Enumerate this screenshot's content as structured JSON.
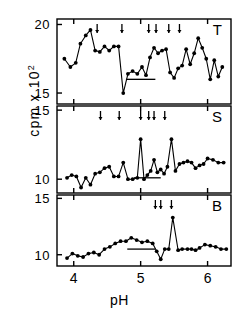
{
  "figure": {
    "ylabel_main": "cpm x 10",
    "ylabel_exp": "2",
    "xlabel": "pH",
    "background": "#ffffff",
    "ink": "#000000"
  },
  "chart_data": {
    "type": "line",
    "title": "",
    "xlabel": "pH",
    "ylabel": "cpm x 10^2",
    "grid": false,
    "legend": "none",
    "xlim": [
      3.75,
      6.35
    ],
    "xticks": [
      4,
      5,
      6
    ],
    "xticklabels": [
      "4",
      "5",
      "6"
    ],
    "panels": [
      {
        "label": "T",
        "label_position": "top-right",
        "ylim": [
          14.2,
          20.4
        ],
        "yticks": [
          15,
          20
        ],
        "yticklabels": [
          "15",
          "20"
        ],
        "marker": "filled-circle",
        "reference_bar": {
          "x_start": 4.78,
          "x_end": 5.22,
          "y": 16.0
        },
        "arrows": [
          4.35,
          4.72,
          5.12,
          5.23,
          5.42,
          5.58
        ],
        "x": [
          3.86,
          3.95,
          4.03,
          4.1,
          4.18,
          4.25,
          4.32,
          4.39,
          4.46,
          4.53,
          4.6,
          4.67,
          4.74,
          4.81,
          4.88,
          4.95,
          5.02,
          5.08,
          5.14,
          5.2,
          5.26,
          5.32,
          5.38,
          5.44,
          5.5,
          5.56,
          5.62,
          5.68,
          5.74,
          5.8,
          5.86,
          5.92,
          5.98,
          6.04,
          6.1,
          6.16,
          6.22
        ],
        "y": [
          17.5,
          16.9,
          17.2,
          18.6,
          19.2,
          19.6,
          18.1,
          18.0,
          18.4,
          18.1,
          18.4,
          18.4,
          15.0,
          16.4,
          16.6,
          16.4,
          16.9,
          16.3,
          17.6,
          18.3,
          17.9,
          18.1,
          18.2,
          16.5,
          16.1,
          16.8,
          17.0,
          18.2,
          17.1,
          17.9,
          19.0,
          18.3,
          17.5,
          16.0,
          17.4,
          16.2,
          16.9
        ]
      },
      {
        "label": "S",
        "label_position": "top-right",
        "ylim": [
          9.0,
          15.3
        ],
        "yticks": [
          10,
          15
        ],
        "yticklabels": [
          "10",
          "15"
        ],
        "marker": "filled-circle",
        "reference_bar": {
          "x_start": 4.9,
          "x_end": 5.3,
          "y": 10.1
        },
        "arrows": [
          4.4,
          4.68,
          5.0,
          5.12,
          5.2,
          5.36
        ],
        "x": [
          3.9,
          3.97,
          4.04,
          4.11,
          4.18,
          4.25,
          4.32,
          4.39,
          4.46,
          4.53,
          4.6,
          4.67,
          4.74,
          4.81,
          4.88,
          4.95,
          5.0,
          5.05,
          5.1,
          5.15,
          5.2,
          5.25,
          5.3,
          5.35,
          5.4,
          5.46,
          5.52,
          5.58,
          5.64,
          5.7,
          5.76,
          5.82,
          5.88,
          5.94,
          6.0,
          6.08,
          6.16,
          6.24
        ],
        "y": [
          10.1,
          10.3,
          10.2,
          9.4,
          10.1,
          9.6,
          10.4,
          10.5,
          10.8,
          10.9,
          10.2,
          10.2,
          11.2,
          10.0,
          10.0,
          10.1,
          12.9,
          10.0,
          10.3,
          10.6,
          11.4,
          10.5,
          10.7,
          10.4,
          10.9,
          12.9,
          10.6,
          11.1,
          11.2,
          11.3,
          11.2,
          10.8,
          11.0,
          11.1,
          11.5,
          11.4,
          11.2,
          11.2
        ]
      },
      {
        "label": "B",
        "label_position": "top-right",
        "ylim": [
          9.0,
          15.3
        ],
        "yticks": [
          10,
          15
        ],
        "yticklabels": [
          "10",
          "15"
        ],
        "marker": "filled-circle",
        "reference_bar": {
          "x_start": 4.8,
          "x_end": 5.22,
          "y": 10.5
        },
        "arrows": [
          5.22,
          5.3,
          5.46
        ],
        "x": [
          3.9,
          3.98,
          4.06,
          4.14,
          4.22,
          4.3,
          4.38,
          4.46,
          4.54,
          4.62,
          4.7,
          4.78,
          4.86,
          4.94,
          5.02,
          5.1,
          5.18,
          5.24,
          5.3,
          5.36,
          5.42,
          5.48,
          5.56,
          5.62,
          5.7,
          5.76,
          5.82,
          5.88,
          5.96,
          6.04,
          6.12,
          6.2,
          6.28
        ],
        "y": [
          9.7,
          10.1,
          9.9,
          9.8,
          10.1,
          10.2,
          10.0,
          10.5,
          10.7,
          11.0,
          11.2,
          11.2,
          11.5,
          11.3,
          11.1,
          11.2,
          11.0,
          10.3,
          9.6,
          10.5,
          10.5,
          13.3,
          10.4,
          10.5,
          10.5,
          10.5,
          10.4,
          10.6,
          10.9,
          10.8,
          10.7,
          10.5,
          10.5
        ]
      }
    ]
  }
}
